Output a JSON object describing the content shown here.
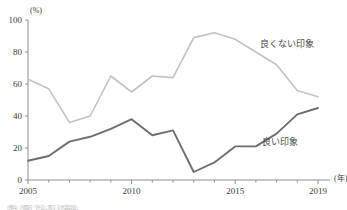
{
  "chart_data": {
    "type": "line",
    "title": "",
    "xlabel": "(年)",
    "ylabel": "(%)",
    "x": [
      2005,
      2006,
      2007,
      2008,
      2009,
      2010,
      2011,
      2012,
      2013,
      2014,
      2015,
      2016,
      2017,
      2018,
      2019
    ],
    "xlim": [
      2005,
      2019
    ],
    "ylim": [
      0,
      100
    ],
    "xticks": [
      2005,
      2010,
      2015,
      2019
    ],
    "xtick_labels": [
      "2005",
      "2010",
      "2015",
      "2019"
    ],
    "yticks": [
      0,
      20,
      40,
      60,
      80,
      100
    ],
    "ytick_labels": [
      "0",
      "20",
      "40",
      "60",
      "80",
      "100"
    ],
    "grid": false,
    "legend_position": "inline-right",
    "series": [
      {
        "name": "良くない印象",
        "color": "#c2c2c2",
        "values": [
          63,
          57,
          36,
          40,
          65,
          55,
          65,
          64,
          89,
          92,
          88,
          80,
          72,
          56,
          52
        ],
        "label_x": 2016.2,
        "label_y": 83
      },
      {
        "name": "良い印象",
        "color": "#6e6e6e",
        "values": [
          12,
          15,
          24,
          27,
          32,
          38,
          28,
          31,
          5,
          11,
          21,
          21,
          29,
          41,
          45
        ],
        "label_x": 2016.3,
        "label_y": 22
      }
    ]
  },
  "axis": {
    "y_unit": "(%)",
    "x_unit": "(年)"
  },
  "footnote": {
    "text": "（資料）内閣府「外交に関する世論調査」"
  }
}
